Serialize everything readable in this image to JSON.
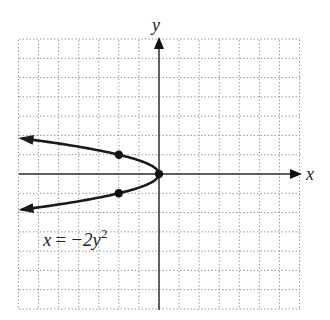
{
  "chart_data": {
    "type": "line",
    "title": "",
    "equation_label": "x = −2y²",
    "equation_parts": {
      "lhs": "x",
      "eq": "=",
      "rhs": "−2y",
      "exp": "2"
    },
    "xlabel": "x",
    "ylabel": "y",
    "xlim": [
      -7,
      7
    ],
    "ylim": [
      -7,
      7
    ],
    "grid": true,
    "grid_style": "dotted",
    "series": [
      {
        "name": "x = -2y^2",
        "x": [
          -7,
          -4.5,
          -2,
          -0.5,
          0,
          -0.5,
          -2,
          -4.5,
          -7
        ],
        "y": [
          1.87,
          1.5,
          1,
          0.5,
          0,
          -0.5,
          -1,
          -1.5,
          -1.87
        ],
        "arrows_at_ends": true
      }
    ],
    "marked_points": [
      {
        "x": -2,
        "y": 1
      },
      {
        "x": 0,
        "y": 0
      },
      {
        "x": -2,
        "y": -1
      }
    ]
  },
  "colors": {
    "curve": "#1a1a1a",
    "axis": "#333333",
    "grid": "#9a9a9a"
  }
}
